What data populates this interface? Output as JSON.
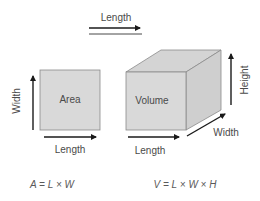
{
  "top_arrow": {
    "label": "Length"
  },
  "area_figure": {
    "shape_label": "Area",
    "width_label": "Width",
    "length_label": "Length",
    "formula": "A = L × W"
  },
  "volume_figure": {
    "shape_label": "Volume",
    "height_label": "Height",
    "width_label": "Width",
    "length_label": "Length",
    "formula": "V = L × W × H"
  },
  "colors": {
    "face_front": "#d9d9d9",
    "face_top": "#d4d4d4",
    "face_side": "#cfcfcf",
    "edge": "#8a8a8a",
    "arrow": "#1a1a1a",
    "text": "#4a4a4a"
  }
}
